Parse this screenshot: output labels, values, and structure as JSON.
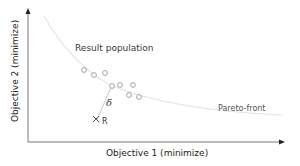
{
  "diagram": {
    "x_axis_label": "Objective 1 (minimize)",
    "y_axis_label": "Objective 2 (minimize)",
    "population_label": "Result population",
    "pareto_label": "Pareto-front",
    "distance_symbol": "δ",
    "reference_label": "R",
    "colors": {
      "axis": "#333333",
      "points": "#9a9a9a",
      "pareto_curve": "#e6e6e6",
      "distance_line": "#bbbbbb",
      "reference_marker": "#555555"
    }
  }
}
